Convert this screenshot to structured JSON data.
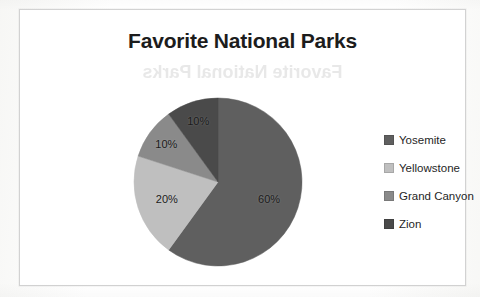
{
  "chart_data": {
    "type": "pie",
    "title": "Favorite National Parks",
    "categories": [
      "Yosemite",
      "Yellowstone",
      "Grand Canyon",
      "Zion"
    ],
    "values": [
      60,
      20,
      10,
      10
    ],
    "value_labels": [
      "60%",
      "20%",
      "10%",
      "10%"
    ],
    "colors": [
      "#5f5f5f",
      "#bfbfbf",
      "#8a8a8a",
      "#4a4a4a"
    ],
    "start_angle_deg": 0,
    "direction": "clockwise",
    "legend_position": "right",
    "grid": false,
    "xlabel": "",
    "ylabel": ""
  },
  "chart": {
    "title": "Favorite National Parks",
    "ghost_text": "Favorite National Parks"
  },
  "slices": [
    {
      "label": "Yosemite",
      "percent_label": "60%",
      "value": 60,
      "color": "#5f5f5f"
    },
    {
      "label": "Yellowstone",
      "percent_label": "20%",
      "value": 20,
      "color": "#bfbfbf"
    },
    {
      "label": "Grand Canyon",
      "percent_label": "10%",
      "value": 10,
      "color": "#8a8a8a"
    },
    {
      "label": "Zion",
      "percent_label": "10%",
      "value": 10,
      "color": "#4a4a4a"
    }
  ],
  "legend": {
    "items": [
      {
        "label": "Yosemite",
        "color": "#5f5f5f"
      },
      {
        "label": "Yellowstone",
        "color": "#bfbfbf"
      },
      {
        "label": "Grand Canyon",
        "color": "#8a8a8a"
      },
      {
        "label": "Zion",
        "color": "#4a4a4a"
      }
    ]
  }
}
